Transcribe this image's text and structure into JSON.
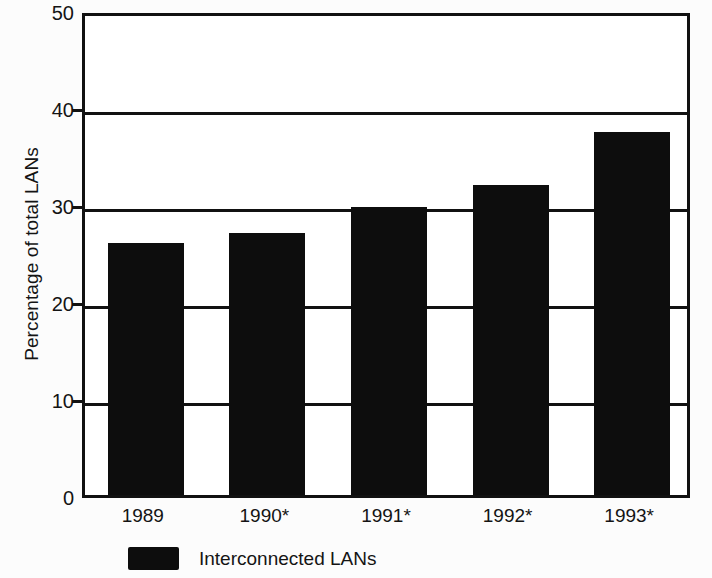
{
  "chart_data": {
    "type": "bar",
    "title": "",
    "subtitle": "",
    "xlabel": "",
    "ylabel": "Percentage of total LANs",
    "categories": [
      "1989",
      "1990*",
      "1991*",
      "1992*",
      "1993*"
    ],
    "values": [
      26,
      27,
      29.7,
      32,
      37.4
    ],
    "series": [
      {
        "name": "Interconnected LANs",
        "color": "#0d0d0d",
        "values": [
          26,
          27,
          29.7,
          32,
          37.4
        ]
      }
    ],
    "ylim": [
      0,
      50
    ],
    "ytick_labels": [
      "0",
      "10",
      "20",
      "30",
      "40",
      "50"
    ],
    "ytick_values": [
      0,
      10,
      20,
      30,
      40,
      50
    ],
    "grid": true,
    "grid_axis": "y",
    "legend": {
      "position": "bottom-left",
      "entries": [
        {
          "label": "Interconnected LANs",
          "color": "#0d0d0d"
        }
      ]
    },
    "footnote": "",
    "axis_color": "#111111",
    "background_color": "#fcfcfc",
    "plot_background_color": "#ffffff"
  }
}
